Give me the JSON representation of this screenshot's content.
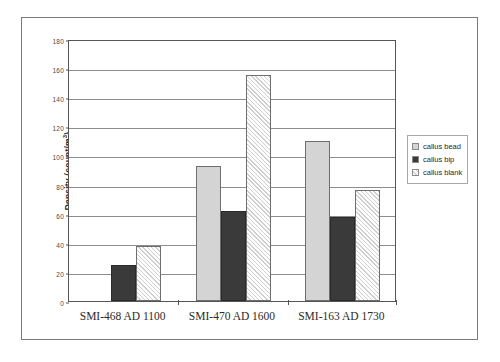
{
  "figure": {
    "y_axis_title_main": "Density (count/m",
    "y_axis_title_sup": "3",
    "y_axis_title_tail": ")"
  },
  "legend": {
    "position": "right",
    "items": [
      {
        "label": "callus bead",
        "swatch": "light-gray-fill",
        "color": "#d4d4d4"
      },
      {
        "label": "callus bip",
        "swatch": "dark-solid-fill",
        "color": "#3a3a3a"
      },
      {
        "label": "callus blank",
        "swatch": "diagonal-hatch-fill",
        "color": "#cfcfcf"
      }
    ]
  },
  "chart_data": {
    "type": "bar",
    "title": "",
    "xlabel": "",
    "ylabel": "Density (count/m3)",
    "ylim": [
      0,
      180
    ],
    "ytick_step": 20,
    "yticks": [
      "0",
      "20",
      "40",
      "60",
      "80",
      "100",
      "120",
      "140",
      "160",
      "180"
    ],
    "grid": true,
    "legend_position": "right",
    "categories": [
      "SMI-468 AD 1100",
      "SMI-470 AD 1600",
      "SMI-163 AD 1730"
    ],
    "series": [
      {
        "name": "callus bead",
        "values": [
          0,
          93,
          110
        ]
      },
      {
        "name": "callus bip",
        "values": [
          25,
          62,
          58
        ]
      },
      {
        "name": "callus blank",
        "values": [
          38,
          155,
          76
        ]
      }
    ]
  }
}
